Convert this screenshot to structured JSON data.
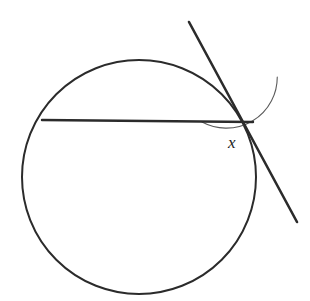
{
  "figure": {
    "type": "geometry-diagram",
    "background_color": "#ffffff",
    "stroke_color": "#2b2b2b",
    "arc_color": "#5a5a5a",
    "canvas": {
      "width": 310,
      "height": 301
    }
  },
  "circle": {
    "name": "circle",
    "center_x": 139,
    "center_y": 177,
    "radius": 117,
    "stroke_width": 2.0,
    "stroke_color": "#2b2b2b",
    "fill": "none"
  },
  "chord": {
    "name": "chord",
    "x1": 42,
    "y1": 120,
    "x2": 253,
    "y2": 122,
    "stroke_width": 2.4,
    "stroke_color": "#2b2b2b"
  },
  "tangent": {
    "name": "tangent-line",
    "x1": 189,
    "y1": 22,
    "x2": 297,
    "y2": 222,
    "stroke_width": 2.6,
    "stroke_color": "#2b2b2b"
  },
  "vertex": {
    "name": "tangent-point",
    "x": 253,
    "y": 122
  },
  "angle_arc": {
    "name": "angle-arc",
    "center_x": 253,
    "center_y": 122,
    "radius": 51,
    "start_angle_deg": 180,
    "end_angle_deg": 61.6,
    "sweep": "counterclockwise",
    "stroke_width": 1.1,
    "stroke_color": "#5a5a5a",
    "path": "M 202 122 A 51 51 0 0 0 277.3 154.0"
  },
  "labels": {
    "angle": {
      "text": "x",
      "x": 228,
      "y": 134,
      "font_size": 17,
      "style": "italic",
      "color": "#1c1c1c"
    }
  }
}
